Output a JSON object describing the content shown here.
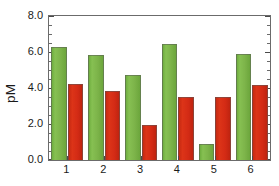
{
  "chart_data": {
    "type": "bar",
    "title": "",
    "subtitle": "",
    "xlabel": "",
    "ylabel": "pM",
    "categories": [
      "1",
      "2",
      "3",
      "4",
      "5",
      "6"
    ],
    "series": [
      {
        "name": "green",
        "color": "#7ab648",
        "values": [
          6.3,
          5.85,
          4.75,
          6.45,
          0.9,
          5.9
        ]
      },
      {
        "name": "red",
        "color": "#d42b15",
        "values": [
          4.25,
          3.85,
          1.95,
          3.5,
          3.5,
          4.15
        ]
      }
    ],
    "ylim": [
      0.0,
      8.0
    ],
    "y_major_ticks": [
      0.0,
      2.0,
      4.0,
      6.0,
      8.0
    ],
    "y_tick_labels": [
      "0.0",
      "2.0",
      "4.0",
      "6.0",
      "8.0"
    ],
    "y_minor_tick_interval": 0.5,
    "grid": false,
    "legend": "none",
    "frame": "box"
  },
  "axis": {
    "y_title": "pM"
  }
}
